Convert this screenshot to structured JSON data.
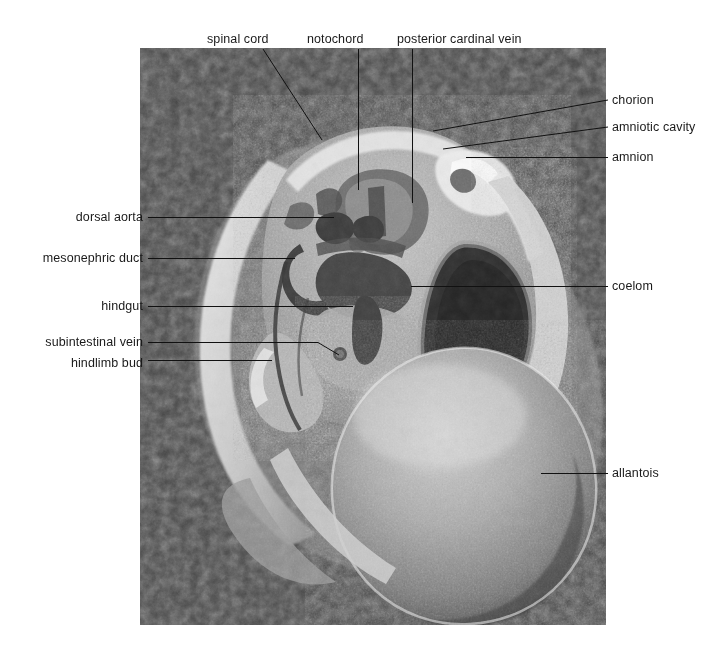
{
  "figure": {
    "type": "scanning-electron-micrograph",
    "image_region": {
      "x": 140,
      "y": 48,
      "width": 466,
      "height": 577
    }
  },
  "labels": {
    "top": [
      {
        "id": "spinal-cord",
        "text": "spinal cord",
        "x": 207,
        "y": 43,
        "leader": {
          "type": "diagonal",
          "x1": 263,
          "y1": 49,
          "x2": 322,
          "y2": 140
        }
      },
      {
        "id": "notochord",
        "text": "notochord",
        "x": 307,
        "y": 43,
        "leader": {
          "type": "vertical",
          "x1": 358,
          "y1": 49,
          "x2": 358,
          "y2": 190
        }
      },
      {
        "id": "posterior-cardinal-vein",
        "text": "posterior cardinal vein",
        "x": 397,
        "y": 43,
        "leader": {
          "type": "vertical",
          "x1": 412,
          "y1": 49,
          "x2": 412,
          "y2": 203
        }
      }
    ],
    "left": [
      {
        "id": "dorsal-aorta",
        "text": "dorsal aorta",
        "right": 143,
        "y": 220,
        "leader": {
          "x1": 148,
          "y1": 217,
          "x2": 334,
          "y2": 217
        }
      },
      {
        "id": "mesonephric-duct",
        "text": "mesonephric duct",
        "right": 143,
        "y": 261,
        "leader": {
          "x1": 148,
          "y1": 258,
          "x2": 295,
          "y2": 258
        }
      },
      {
        "id": "hindgut",
        "text": "hindgut",
        "right": 143,
        "y": 309,
        "leader": {
          "x1": 148,
          "y1": 306,
          "x2": 353,
          "y2": 306
        }
      },
      {
        "id": "subintestinal-vein",
        "text": "subintestinal vein",
        "right": 143,
        "y": 345,
        "leader": {
          "x1": 148,
          "y1": 342,
          "x2": 318,
          "y2": 342,
          "diagonal_x": 338,
          "diagonal_y": 354
        }
      },
      {
        "id": "hindlimb-bud",
        "text": "hindlimb bud",
        "right": 143,
        "y": 366,
        "leader": {
          "x1": 148,
          "y1": 360,
          "x2": 272,
          "y2": 360
        }
      }
    ],
    "right": [
      {
        "id": "chorion",
        "text": "chorion",
        "x": 612,
        "y": 104,
        "leader": {
          "x1": 433,
          "y1": 131,
          "x2": 608,
          "y2": 100
        }
      },
      {
        "id": "amniotic-cavity",
        "text": "amniotic cavity",
        "x": 612,
        "y": 131,
        "leader": {
          "x1": 443,
          "y1": 149,
          "x2": 608,
          "y2": 127
        }
      },
      {
        "id": "amnion",
        "text": "amnion",
        "x": 612,
        "y": 161,
        "leader": {
          "x1": 466,
          "y1": 157,
          "x2": 608,
          "y2": 157
        }
      },
      {
        "id": "coelom",
        "text": "coelom",
        "x": 612,
        "y": 290,
        "leader": {
          "x1": 411,
          "y1": 286,
          "x2": 608,
          "y2": 286
        }
      },
      {
        "id": "allantois",
        "text": "allantois",
        "x": 612,
        "y": 477,
        "leader": {
          "x1": 541,
          "y1": 473,
          "x2": 608,
          "y2": 473
        }
      }
    ]
  },
  "style": {
    "leader_color": "#111111",
    "text_color": "#1a1a1a",
    "background": "#ffffff"
  }
}
